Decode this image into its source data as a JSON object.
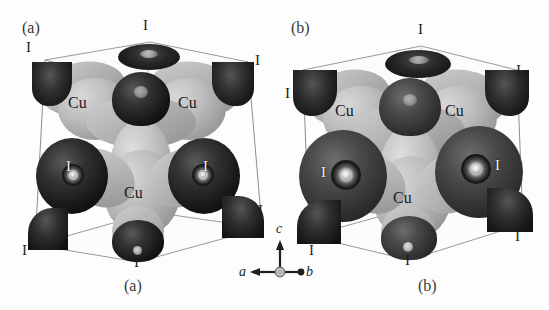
{
  "figure": {
    "type": "crystal-structure-isosurface-pair",
    "background_color": "#fdfdfd",
    "width": 549,
    "height": 310
  },
  "panels": [
    {
      "id": "a",
      "tag_top_left": "(a)",
      "caption_bottom": "(a)",
      "atom_labels": {
        "cu": [
          "Cu",
          "Cu",
          "Cu"
        ],
        "iodine": [
          "I",
          "I",
          "I",
          "I",
          "I",
          "I",
          "I",
          "I"
        ]
      },
      "labels": [
        {
          "text": "I",
          "position": "top-left-corner"
        },
        {
          "text": "I",
          "position": "top-center"
        },
        {
          "text": "I",
          "position": "top-right-corner"
        },
        {
          "text": "Cu",
          "position": "upper-left-lobe"
        },
        {
          "text": "Cu",
          "position": "upper-right-lobe"
        },
        {
          "text": "I",
          "position": "mid-left-sphere"
        },
        {
          "text": "I",
          "position": "mid-right-sphere"
        },
        {
          "text": "Cu",
          "position": "center-lower-lobe"
        },
        {
          "text": "I",
          "position": "lower-right-corner"
        },
        {
          "text": "I",
          "position": "bottom-left-corner"
        },
        {
          "text": "I",
          "position": "bottom-center"
        }
      ]
    },
    {
      "id": "b",
      "tag_top_left": "(b)",
      "caption_bottom": "(b)",
      "atom_labels": {
        "cu": [
          "Cu",
          "Cu",
          "Cu"
        ],
        "iodine": [
          "I",
          "I",
          "I",
          "I",
          "I",
          "I",
          "I",
          "I"
        ]
      },
      "labels": [
        {
          "text": "I",
          "position": "top-center"
        },
        {
          "text": "I",
          "position": "left-corner"
        },
        {
          "text": "I",
          "position": "right-corner"
        },
        {
          "text": "Cu",
          "position": "upper-left-lobe"
        },
        {
          "text": "Cu",
          "position": "upper-right-lobe"
        },
        {
          "text": "I",
          "position": "mid-left-sphere"
        },
        {
          "text": "I",
          "position": "mid-right-sphere"
        },
        {
          "text": "Cu",
          "position": "center-lower-lobe"
        },
        {
          "text": "I",
          "position": "bottom-left-corner"
        },
        {
          "text": "I",
          "position": "bottom-center"
        },
        {
          "text": "I",
          "position": "bottom-right-corner"
        }
      ]
    }
  ],
  "axis_triad": {
    "up_axis": "c",
    "left_axis": "a",
    "right_axis": "b"
  },
  "colors": {
    "iodine_dark": "#141414",
    "copper_gray": "#b0b0b0",
    "cell_edge": "#8d8d8d",
    "text": "#1e1e1e",
    "background": "#fdfdfd"
  }
}
